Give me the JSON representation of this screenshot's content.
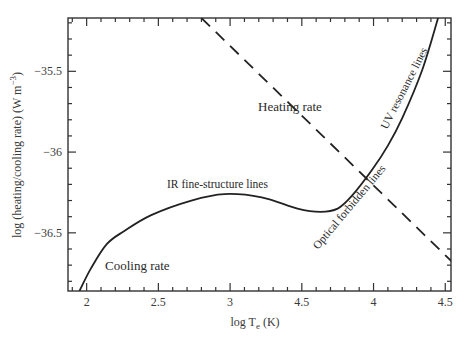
{
  "chart_data": {
    "type": "line",
    "title": "",
    "xlabel": "log T_e (K)",
    "xlabel_parts": {
      "main": "log T",
      "sub": "e",
      "unit": " (K)"
    },
    "ylabel": "log (heating/cooling rate) (W m^-3)",
    "ylabel_parts": {
      "main": "log (heating/cooling rate) (W m",
      "sup": "−3",
      "end": ")"
    },
    "xlim": [
      1.87,
      4.54
    ],
    "ylim": [
      -36.86,
      -35.17
    ],
    "grid": false,
    "legend": null,
    "x_ticks": [
      {
        "value": 2.0,
        "label": "2"
      },
      {
        "value": 2.5,
        "label": "2.5"
      },
      {
        "value": 3.0,
        "label": "3"
      },
      {
        "value": 3.5,
        "label": "4.5"
      },
      {
        "value": 4.0,
        "label": "4"
      },
      {
        "value": 4.5,
        "label": "4.5"
      }
    ],
    "y_ticks": [
      {
        "value": -35.5,
        "label": "−35.5"
      },
      {
        "value": -36.0,
        "label": "−36"
      },
      {
        "value": -36.5,
        "label": "−36.5"
      }
    ],
    "series": [
      {
        "name": "Cooling rate",
        "style": "solid",
        "x": [
          1.95,
          2.03,
          2.14,
          2.26,
          2.45,
          2.73,
          2.96,
          3.22,
          3.47,
          3.63,
          3.75,
          3.85,
          3.99,
          4.1,
          4.2,
          4.34,
          4.45
        ],
        "y": [
          -36.86,
          -36.72,
          -36.57,
          -36.49,
          -36.39,
          -36.3,
          -36.26,
          -36.28,
          -36.35,
          -36.37,
          -36.35,
          -36.27,
          -36.11,
          -35.96,
          -35.79,
          -35.49,
          -35.17
        ]
      },
      {
        "name": "Heating rate",
        "style": "dashed",
        "x": [
          2.8,
          4.56
        ],
        "y": [
          -35.17,
          -36.69
        ]
      }
    ],
    "annotations": [
      {
        "text": "Heating rate",
        "x": 3.15,
        "y": -35.48,
        "rotation": 0
      },
      {
        "text": "IR fine-structure lines",
        "x": 2.55,
        "y": -36.2,
        "rotation": 0
      },
      {
        "text": "Cooling rate",
        "x": 2.15,
        "y": -36.72,
        "rotation": 0
      },
      {
        "text": "UV resonance lines",
        "x": 4.25,
        "y": -35.8,
        "rotation": -62
      },
      {
        "text": "Optical forbidden lines",
        "x": 4.0,
        "y": -36.48,
        "rotation": -50
      }
    ]
  }
}
